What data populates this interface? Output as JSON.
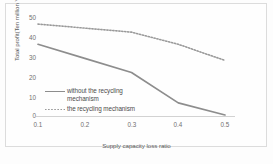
{
  "chart_data": {
    "type": "line",
    "title": "",
    "xlabel": "Supply capacity loss ratio",
    "ylabel": "Total profit(Ten million Yuan)",
    "x": [
      0.1,
      0.2,
      0.3,
      0.4,
      0.5
    ],
    "xticklabels": [
      "0.1",
      "0.2",
      "0.3",
      "0.4",
      "0.5"
    ],
    "yticklabels": [
      "0",
      "10",
      "20",
      "30",
      "40",
      "50"
    ],
    "xlim": [
      0.05,
      0.55
    ],
    "ylim": [
      0,
      50
    ],
    "grid": false,
    "legend_position": "inside-left",
    "series": [
      {
        "name": "without the recycling mechanism",
        "style": "solid",
        "color": "#8d8d8d",
        "values": [
          36,
          29,
          22,
          7,
          1
        ]
      },
      {
        "name": "the recycling mechanism",
        "style": "dotted",
        "color": "#9a9a9a",
        "values": [
          46,
          44,
          42,
          36,
          28
        ]
      }
    ]
  },
  "axes": {
    "ytitle": "Total profit(Ten million Yuan)",
    "xtitle": "Supply capacity loss ratio",
    "yticks": [
      "50",
      "40",
      "30",
      "20",
      "10",
      "0"
    ],
    "xticks": [
      "0.1",
      "0.2",
      "0.3",
      "0.4",
      "0.5"
    ]
  },
  "legend": {
    "items": [
      {
        "line1": "without the recycling",
        "line2": "mechanism",
        "marker": "solid-line-marker"
      },
      {
        "line1": "the recycling mechanism",
        "line2": "",
        "marker": "dotted-line-marker"
      }
    ]
  }
}
